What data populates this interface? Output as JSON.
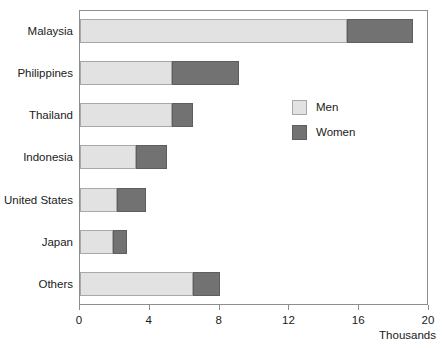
{
  "chart_data": {
    "type": "bar",
    "orientation": "horizontal",
    "stacked": true,
    "title": "",
    "subtitle": "",
    "xlabel": "Thousands",
    "ylabel": "",
    "xlim": [
      0,
      20
    ],
    "xticks": [
      0,
      4,
      8,
      12,
      16,
      20
    ],
    "xtick_labels": [
      "0",
      "4",
      "8",
      "12",
      "16",
      "20"
    ],
    "grid": false,
    "legend_position": "inside-right",
    "categories": [
      "Malaysia",
      "Philippines",
      "Thailand",
      "Indonesia",
      "United States",
      "Japan",
      "Others"
    ],
    "series": [
      {
        "name": "Men",
        "color": "#e2e2e2",
        "values": [
          15.3,
          5.3,
          5.3,
          3.2,
          2.1,
          1.9,
          6.5
        ]
      },
      {
        "name": "Women",
        "color": "#727272",
        "values": [
          3.8,
          3.8,
          1.2,
          1.8,
          1.7,
          0.8,
          1.5
        ]
      }
    ],
    "totals": [
      19.1,
      9.1,
      6.5,
      5.0,
      3.8,
      2.7,
      8.0
    ]
  },
  "legend": {
    "items": [
      {
        "label": "Men",
        "swatch": "men"
      },
      {
        "label": "Women",
        "swatch": "women"
      }
    ]
  },
  "axis": {
    "unit_label": "Thousands"
  },
  "colors": {
    "men": "#e2e2e2",
    "women": "#727272",
    "frame": "#8d8d8d",
    "text": "#1a1a1a",
    "background": "#ffffff"
  }
}
